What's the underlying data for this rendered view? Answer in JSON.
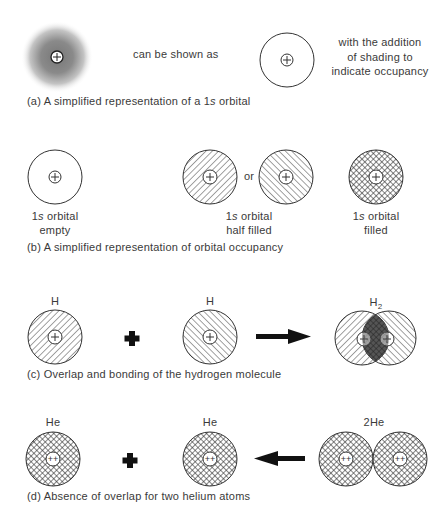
{
  "panel_a": {
    "middle_text": "can be shown as",
    "right_text": [
      "with the addition",
      "of shading to",
      "indicate occupancy"
    ],
    "caption_prefix": "(a) A simplified representation of a 1",
    "caption_italic": "s",
    "caption_suffix": " orbital"
  },
  "panel_b": {
    "empty": {
      "l1_num": "1",
      "l1_it": "s",
      "l1_rest": " orbital",
      "l2": "empty"
    },
    "half": {
      "l1_num": "1",
      "l1_it": "s",
      "l1_rest": " orbital",
      "l2": "half filled"
    },
    "or_text": "or",
    "filled": {
      "l1_num": "1",
      "l1_it": "s",
      "l1_rest": " orbital",
      "l2": "filled"
    },
    "caption": "(b) A simplified representation of orbital occupancy"
  },
  "panel_c": {
    "atom1_label": "H",
    "atom2_label": "H",
    "product_label": "H",
    "product_subscript": "2",
    "caption": "(c) Overlap and bonding of the hydrogen molecule"
  },
  "panel_d": {
    "atom1_label": "He",
    "atom2_label": "He",
    "product_label": "2He",
    "caption": "(d) Absence of overlap for two helium atoms"
  },
  "icons": {
    "nucleus_h": "+",
    "nucleus_he": "++",
    "plus_symbol": "plus",
    "arrow_right": "arrow-right",
    "arrow_left": "arrow-left"
  }
}
